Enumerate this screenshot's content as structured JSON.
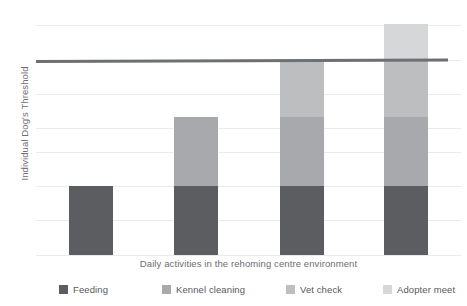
{
  "chart_data": {
    "type": "bar",
    "stacked": true,
    "title": "",
    "subtitle": "",
    "xlabel": "Daily activities in the rehoming centre environment",
    "ylabel": "Individual Dog's Threshold",
    "categories": [
      "Feeding",
      "Feeding + Kennel cleaning",
      "Feeding + Kennel cleaning + Vet check",
      "Feeding + Kennel cleaning + Vet check + Adopter meet"
    ],
    "series": [
      {
        "name": "Feeding",
        "color": "#5c5d60",
        "values": [
          29,
          29,
          29,
          29
        ]
      },
      {
        "name": "Kennel cleaning",
        "color": "#a7a9ac",
        "values": [
          0,
          29,
          29,
          29
        ]
      },
      {
        "name": "Vet check",
        "color": "#bcbec0",
        "values": [
          0,
          0,
          24,
          24
        ]
      },
      {
        "name": "Adopter meet",
        "color": "#d6d7d9",
        "values": [
          0,
          0,
          0,
          15
        ]
      }
    ],
    "bar_totals": [
      29,
      58,
      82,
      97
    ],
    "threshold": {
      "label": "Individual Dog's Threshold",
      "value": 82,
      "color": "#6d6f72"
    },
    "ylim": [
      0,
      100
    ],
    "grid": true,
    "gridline_count": 8,
    "legend_position": "bottom",
    "legend": [
      "Feeding",
      "Kennel cleaning",
      "Vet check",
      "Adopter meet"
    ]
  },
  "axes": {
    "y_title": "Individual Dog's Threshold",
    "x_title": "Daily activities in the rehoming centre environment"
  },
  "legend": {
    "items": [
      {
        "label": "Feeding",
        "color": "#5c5d60"
      },
      {
        "label": "Kennel cleaning",
        "color": "#a7a9ac"
      },
      {
        "label": "Vet check",
        "color": "#bcbec0"
      },
      {
        "label": "Adopter meet",
        "color": "#d6d7d9"
      }
    ]
  },
  "layout": {
    "gridlines_y": [
      9,
      44,
      78,
      112,
      136,
      170,
      204,
      239
    ],
    "bar_x": [
      33,
      138,
      244,
      348
    ],
    "bar_width": 44,
    "plot_height": 240,
    "bars": [
      {
        "segments": [
          {
            "series": 0,
            "top": 170,
            "height": 69
          }
        ]
      },
      {
        "segments": [
          {
            "series": 0,
            "top": 170,
            "height": 69
          },
          {
            "series": 1,
            "top": 101,
            "height": 69
          }
        ]
      },
      {
        "segments": [
          {
            "series": 0,
            "top": 170,
            "height": 69
          },
          {
            "series": 1,
            "top": 101,
            "height": 69
          },
          {
            "series": 2,
            "top": 44,
            "height": 57
          }
        ]
      },
      {
        "segments": [
          {
            "series": 0,
            "top": 170,
            "height": 69
          },
          {
            "series": 1,
            "top": 101,
            "height": 69
          },
          {
            "series": 2,
            "top": 44,
            "height": 57
          },
          {
            "series": 3,
            "top": 8,
            "height": 36
          }
        ]
      }
    ],
    "legend_x": [
      23,
      126,
      250,
      347
    ]
  }
}
